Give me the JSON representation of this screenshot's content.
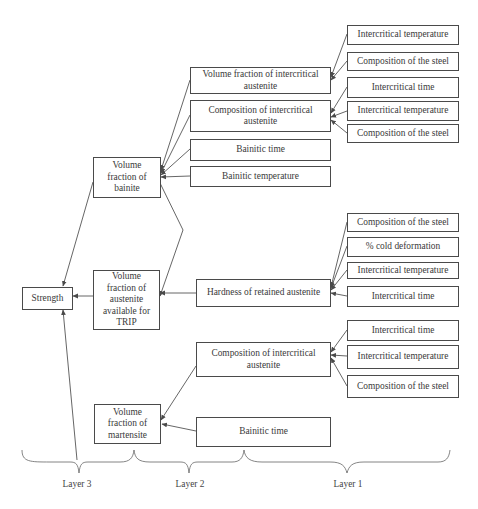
{
  "diagram": {
    "type": "hierarchical influence diagram",
    "root": {
      "id": "strength",
      "label": "Strength"
    },
    "layer3": [
      {
        "id": "vf_bainite",
        "label": "Volume fraction of bainite"
      },
      {
        "id": "vf_austenite",
        "label": "Volume fraction of austenite available for TRIP"
      },
      {
        "id": "vf_martensite",
        "label": "Volume fraction of martensite"
      }
    ],
    "layer2": [
      {
        "id": "vf_intercritical_austenite",
        "label": "Volume fraction of intercritical austenite",
        "target": "vf_bainite"
      },
      {
        "id": "comp_intercritical_austenite_1",
        "label": "Composition of intercritical austenite",
        "target": "vf_bainite"
      },
      {
        "id": "bainitic_time_1",
        "label": "Bainitic time",
        "target": "vf_bainite"
      },
      {
        "id": "bainitic_temperature",
        "label": "Bainitic temperature",
        "target": "vf_bainite"
      },
      {
        "id": "hardness_retained_austenite",
        "label": "Hardness of retained austenite",
        "target": "vf_austenite"
      },
      {
        "id": "comp_intercritical_austenite_2",
        "label": "Composition of intercritical austenite",
        "target": "vf_martensite"
      },
      {
        "id": "bainitic_time_2",
        "label": "Bainitic time",
        "target": "vf_martensite"
      }
    ],
    "layer1": [
      {
        "label": "Intercritical temperature",
        "target": "vf_intercritical_austenite"
      },
      {
        "label": "Composition of the steel",
        "target": "vf_intercritical_austenite"
      },
      {
        "label": "Intercritical time",
        "target": "comp_intercritical_austenite_1"
      },
      {
        "label": "Intercritical temperature",
        "target": "comp_intercritical_austenite_1"
      },
      {
        "label": "Composition of the steel",
        "target": "comp_intercritical_austenite_1"
      },
      {
        "label": "Composition of the steel",
        "target": "hardness_retained_austenite"
      },
      {
        "label": "% cold deformation",
        "target": "hardness_retained_austenite"
      },
      {
        "label": "Intercritical temperature",
        "target": "hardness_retained_austenite"
      },
      {
        "label": "Intercritical time",
        "target": "hardness_retained_austenite"
      },
      {
        "label": "Intercritical time",
        "target": "comp_intercritical_austenite_2"
      },
      {
        "label": "Intercritical temperature",
        "target": "comp_intercritical_austenite_2"
      },
      {
        "label": "Composition of the steel",
        "target": "comp_intercritical_austenite_2"
      }
    ],
    "extra_edges": [
      {
        "from": "vf_bainite",
        "to": "strength"
      },
      {
        "from": "vf_austenite",
        "to": "strength"
      },
      {
        "from": "vf_martensite",
        "to": "strength"
      },
      {
        "from": "vf_bainite",
        "to": "vf_austenite"
      }
    ],
    "layer_labels": [
      "Layer 3",
      "Layer 2",
      "Layer 1"
    ]
  },
  "labels": {
    "strength": "Strength",
    "vf_bainite": [
      "Volume",
      "fraction of",
      "bainite"
    ],
    "vf_austenite": [
      "Volume",
      "fraction of",
      "austenite",
      "available for",
      "TRIP"
    ],
    "vf_martensite": [
      "Volume",
      "fraction of",
      "martensite"
    ],
    "vf_intercritical_austenite": [
      "Volume fraction of intercritical",
      "austenite"
    ],
    "comp_ia_1": [
      "Composition of intercritical",
      "austenite"
    ],
    "bainitic_time_1": "Bainitic time",
    "bainitic_temperature": "Bainitic temperature",
    "hardness": "Hardness of retained austenite",
    "comp_ia_2": [
      "Composition of intercritical",
      "austenite"
    ],
    "bainitic_time_2": "Bainitic time",
    "r1": "Intercritical temperature",
    "r2": "Composition of the steel",
    "r3": "Intercritical time",
    "r4": "Intercritical temperature",
    "r5": "Composition of the steel",
    "r6": "Composition of the steel",
    "r7": "% cold deformation",
    "r8": "Intercritical temperature",
    "r9": "Intercritical time",
    "r10": "Intercritical time",
    "r11": "Intercritical temperature",
    "r12": "Composition of the steel",
    "layer3": "Layer 3",
    "layer2": "Layer 2",
    "layer1": "Layer 1"
  },
  "colors": {
    "line": "#4a4a4a",
    "text": "#3a3a3a",
    "background": "#ffffff"
  }
}
